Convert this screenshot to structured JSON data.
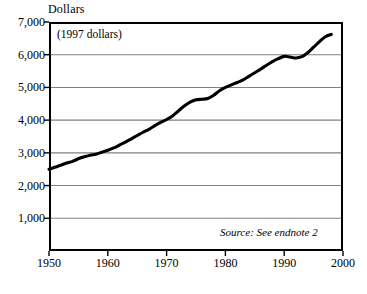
{
  "chart_data": {
    "type": "line",
    "title": "Dollars",
    "subtitle": "(1997 dollars)",
    "xlabel": "",
    "ylabel": "Dollars",
    "annotation": "Source: See endnote 2",
    "xlim": [
      1950,
      2000
    ],
    "ylim": [
      0,
      7000
    ],
    "xticks": [
      1950,
      1960,
      1970,
      1980,
      1990,
      2000
    ],
    "xtick_labels": [
      "1950",
      "1960",
      "1970",
      "1980",
      "1990",
      "2000"
    ],
    "yticks": [
      1000,
      2000,
      3000,
      4000,
      5000,
      6000,
      7000
    ],
    "ytick_labels": [
      "1,000",
      "2,000",
      "3,000",
      "4,000",
      "5,000",
      "6,000",
      "7,000"
    ],
    "grid": "horizontal",
    "legend": "none",
    "line_color": "#000000",
    "grid_color": "#808080",
    "axis_color": "#000000",
    "series": [
      {
        "name": "Dollars (1997 dollars)",
        "x": [
          1950,
          1951,
          1952,
          1953,
          1954,
          1955,
          1956,
          1957,
          1958,
          1959,
          1960,
          1961,
          1962,
          1963,
          1964,
          1965,
          1966,
          1967,
          1968,
          1969,
          1970,
          1971,
          1972,
          1973,
          1974,
          1975,
          1976,
          1977,
          1978,
          1979,
          1980,
          1981,
          1982,
          1983,
          1984,
          1985,
          1986,
          1987,
          1988,
          1989,
          1990,
          1991,
          1992,
          1993,
          1994,
          1995,
          1996,
          1997,
          1998
        ],
        "values": [
          2500,
          2560,
          2620,
          2690,
          2740,
          2820,
          2880,
          2930,
          2960,
          3020,
          3080,
          3150,
          3240,
          3330,
          3430,
          3530,
          3630,
          3720,
          3830,
          3930,
          4020,
          4130,
          4280,
          4430,
          4550,
          4620,
          4640,
          4660,
          4760,
          4900,
          5000,
          5080,
          5150,
          5230,
          5340,
          5450,
          5560,
          5680,
          5790,
          5880,
          5950,
          5930,
          5900,
          5940,
          6060,
          6230,
          6400,
          6550,
          6620
        ]
      }
    ]
  }
}
